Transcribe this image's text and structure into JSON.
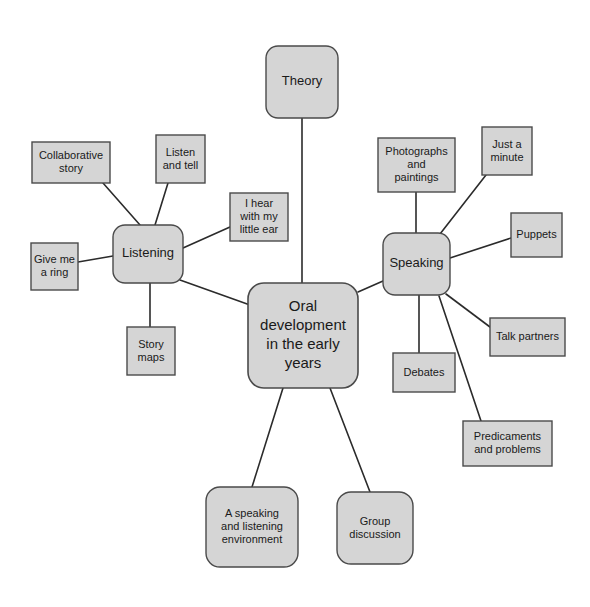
{
  "diagram": {
    "type": "mind-map",
    "title_node": "Oral development in the early years",
    "palette": {
      "node_fill": "#d5d5d5",
      "node_stroke": "#4a4a4a",
      "edge_stroke": "#2b2b2b",
      "text_color": "#1a1a1a",
      "background": "#ffffff"
    },
    "central": {
      "id": "central",
      "label": "Oral development in the early years",
      "lines": [
        "Oral",
        "development",
        "in the early",
        "years"
      ],
      "shape": "rounded-rect",
      "x": 248,
      "y": 283,
      "w": 110,
      "h": 105,
      "r": 16
    },
    "branches": [
      {
        "id": "theory",
        "label": "Theory",
        "lines": [
          "Theory"
        ],
        "shape": "rounded-rect",
        "x": 266,
        "y": 46,
        "w": 72,
        "h": 72,
        "r": 12,
        "connects_to": "central"
      },
      {
        "id": "listening",
        "label": "Listening",
        "lines": [
          "Listening"
        ],
        "shape": "rounded-rect",
        "x": 113,
        "y": 225,
        "w": 70,
        "h": 58,
        "r": 12,
        "connects_to": "central"
      },
      {
        "id": "speaking",
        "label": "Speaking",
        "lines": [
          "Speaking"
        ],
        "shape": "rounded-rect",
        "x": 383,
        "y": 233,
        "w": 67,
        "h": 62,
        "r": 12,
        "connects_to": "central"
      },
      {
        "id": "speaking-listening-environment",
        "label": "A speaking and listening environment",
        "lines": [
          "A speaking",
          "and listening",
          "environment"
        ],
        "shape": "rounded-rect",
        "x": 206,
        "y": 487,
        "w": 92,
        "h": 80,
        "r": 14,
        "connects_to": "central"
      },
      {
        "id": "group-discussion",
        "label": "Group discussion",
        "lines": [
          "Group",
          "discussion"
        ],
        "shape": "rounded-rect",
        "x": 337,
        "y": 492,
        "w": 76,
        "h": 72,
        "r": 14,
        "connects_to": "central"
      }
    ],
    "listening_leaves": [
      {
        "id": "collaborative-story",
        "label": "Collaborative story",
        "lines": [
          "Collaborative",
          "story"
        ],
        "shape": "rect",
        "x": 32,
        "y": 142,
        "w": 78,
        "h": 41,
        "connects_to": "listening"
      },
      {
        "id": "listen-and-tell",
        "label": "Listen and tell",
        "lines": [
          "Listen",
          "and tell"
        ],
        "shape": "rect",
        "x": 156,
        "y": 135,
        "w": 49,
        "h": 48,
        "connects_to": "listening"
      },
      {
        "id": "i-hear-with-my-little-ear",
        "label": "I hear with my little ear",
        "lines": [
          "I hear",
          "with my",
          "little ear"
        ],
        "shape": "rect",
        "x": 230,
        "y": 193,
        "w": 58,
        "h": 48,
        "connects_to": "listening"
      },
      {
        "id": "give-me-a-ring",
        "label": "Give me a ring",
        "lines": [
          "Give me",
          "a ring"
        ],
        "shape": "rect",
        "x": 31,
        "y": 243,
        "w": 47,
        "h": 47,
        "connects_to": "listening"
      },
      {
        "id": "story-maps",
        "label": "Story maps",
        "lines": [
          "Story",
          "maps"
        ],
        "shape": "rect",
        "x": 127,
        "y": 327,
        "w": 48,
        "h": 48,
        "connects_to": "listening"
      }
    ],
    "speaking_leaves": [
      {
        "id": "photographs-and-paintings",
        "label": "Photographs and paintings",
        "lines": [
          "Photographs",
          "and",
          "paintings"
        ],
        "shape": "rect",
        "x": 378,
        "y": 138,
        "w": 77,
        "h": 54,
        "connects_to": "speaking"
      },
      {
        "id": "just-a-minute",
        "label": "Just a minute",
        "lines": [
          "Just a",
          "minute"
        ],
        "shape": "rect",
        "x": 482,
        "y": 127,
        "w": 50,
        "h": 48,
        "connects_to": "speaking"
      },
      {
        "id": "puppets",
        "label": "Puppets",
        "lines": [
          "Puppets"
        ],
        "shape": "rect",
        "x": 511,
        "y": 213,
        "w": 51,
        "h": 44,
        "connects_to": "speaking"
      },
      {
        "id": "talk-partners",
        "label": "Talk partners",
        "lines": [
          "Talk partners"
        ],
        "shape": "rect",
        "x": 490,
        "y": 318,
        "w": 75,
        "h": 38,
        "connects_to": "speaking"
      },
      {
        "id": "debates",
        "label": "Debates",
        "lines": [
          "Debates"
        ],
        "shape": "rect",
        "x": 393,
        "y": 353,
        "w": 62,
        "h": 39,
        "connects_to": "speaking"
      },
      {
        "id": "predicaments-and-problems",
        "label": "Predicaments and problems",
        "lines": [
          "Predicaments",
          "and problems"
        ],
        "shape": "rect",
        "x": 463,
        "y": 421,
        "w": 89,
        "h": 45,
        "connects_to": "speaking"
      }
    ],
    "edges": [
      {
        "id": "edge-theory-central",
        "from": "theory",
        "to": "central",
        "x1": 302,
        "y1": 118,
        "x2": 302,
        "y2": 283
      },
      {
        "id": "edge-listening-central",
        "from": "listening",
        "to": "central",
        "x1": 180,
        "y1": 280,
        "x2": 250,
        "y2": 305
      },
      {
        "id": "edge-speaking-central",
        "from": "speaking",
        "to": "central",
        "x1": 383,
        "y1": 281,
        "x2": 358,
        "y2": 292
      },
      {
        "id": "edge-environment-central",
        "from": "speaking-listening-environment",
        "to": "central",
        "x1": 283,
        "y1": 388,
        "x2": 252,
        "y2": 487
      },
      {
        "id": "edge-group-central",
        "from": "group-discussion",
        "to": "central",
        "x1": 330,
        "y1": 388,
        "x2": 370,
        "y2": 492
      },
      {
        "id": "edge-collab-listening",
        "from": "collaborative-story",
        "to": "listening",
        "x1": 103,
        "y1": 183,
        "x2": 140,
        "y2": 225
      },
      {
        "id": "edge-listentell-listening",
        "from": "listen-and-tell",
        "to": "listening",
        "x1": 168,
        "y1": 183,
        "x2": 155,
        "y2": 225
      },
      {
        "id": "edge-ihear-listening",
        "from": "i-hear-with-my-little-ear",
        "to": "listening",
        "x1": 230,
        "y1": 227,
        "x2": 183,
        "y2": 248
      },
      {
        "id": "edge-givering-listening",
        "from": "give-me-a-ring",
        "to": "listening",
        "x1": 78,
        "y1": 262,
        "x2": 113,
        "y2": 256
      },
      {
        "id": "edge-storymaps-listening",
        "from": "story-maps",
        "to": "listening",
        "x1": 150,
        "y1": 327,
        "x2": 150,
        "y2": 283
      },
      {
        "id": "edge-photos-speaking",
        "from": "photographs-and-paintings",
        "to": "speaking",
        "x1": 416,
        "y1": 192,
        "x2": 416,
        "y2": 233
      },
      {
        "id": "edge-justaminute-speaking",
        "from": "just-a-minute",
        "to": "speaking",
        "x1": 486,
        "y1": 175,
        "x2": 440,
        "y2": 234
      },
      {
        "id": "edge-puppets-speaking",
        "from": "puppets",
        "to": "speaking",
        "x1": 511,
        "y1": 238,
        "x2": 450,
        "y2": 258
      },
      {
        "id": "edge-talkpartners-speaking",
        "from": "talk-partners",
        "to": "speaking",
        "x1": 490,
        "y1": 327,
        "x2": 446,
        "y2": 294
      },
      {
        "id": "edge-debates-speaking",
        "from": "debates",
        "to": "speaking",
        "x1": 419,
        "y1": 353,
        "x2": 419,
        "y2": 295
      },
      {
        "id": "edge-predicaments-speaking",
        "from": "predicaments-and-problems",
        "to": "speaking",
        "x1": 481,
        "y1": 421,
        "x2": 439,
        "y2": 296
      }
    ]
  }
}
